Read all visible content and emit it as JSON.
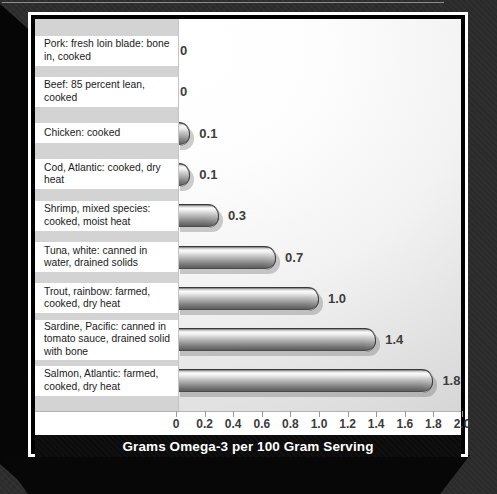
{
  "chart_data": {
    "type": "bar",
    "orientation": "horizontal",
    "title": "Grams Omega-3 per 100 Gram Serving",
    "xlabel": "Grams Omega-3 per 100 Gram Serving",
    "ylabel": "",
    "xlim": [
      0,
      2.0
    ],
    "xticks": [
      "0",
      "0.2",
      "0.4",
      "0.6",
      "0.8",
      "1.0",
      "1.2",
      "1.4",
      "1.6",
      "1.8",
      "2.0"
    ],
    "xtick_values": [
      0,
      0.2,
      0.4,
      0.6,
      0.8,
      1.0,
      1.2,
      1.4,
      1.6,
      1.8,
      2.0
    ],
    "grid": false,
    "legend": null,
    "categories": [
      "Pork: fresh loin blade: bone in, cooked",
      "Beef: 85 percent lean, cooked",
      "Chicken: cooked",
      "Cod, Atlantic: cooked, dry heat",
      "Shrimp, mixed species: cooked, moist heat",
      "Tuna, white: canned in water, drained solids",
      "Trout, rainbow: farmed, cooked, dry heat",
      "Sardine, Pacific: canned in tomato sauce, drained solid with bone",
      "Salmon, Atlantic: farmed, cooked, dry heat"
    ],
    "values": [
      0,
      0,
      0.1,
      0.1,
      0.3,
      0.7,
      1.0,
      1.4,
      1.8
    ],
    "value_labels": [
      "0",
      "0",
      "0.1",
      "0.1",
      "0.3",
      "0.7",
      "1.0",
      "1.4",
      "1.8"
    ]
  },
  "rows": [
    {
      "label": "Pork: fresh loin blade: bone in, cooked",
      "value": 0,
      "value_label": "0"
    },
    {
      "label": "Beef: 85 percent lean, cooked",
      "value": 0,
      "value_label": "0"
    },
    {
      "label": "Chicken: cooked",
      "value": 0.1,
      "value_label": "0.1"
    },
    {
      "label": "Cod, Atlantic: cooked, dry heat",
      "value": 0.1,
      "value_label": "0.1"
    },
    {
      "label": "Shrimp, mixed species: cooked, moist heat",
      "value": 0.3,
      "value_label": "0.3"
    },
    {
      "label": "Tuna, white: canned in water, drained solids",
      "value": 0.7,
      "value_label": "0.7"
    },
    {
      "label": "Trout, rainbow: farmed, cooked, dry heat",
      "value": 1.0,
      "value_label": "1.0"
    },
    {
      "label": "Sardine, Pacific: canned in tomato sauce, drained solid with bone",
      "value": 1.4,
      "value_label": "1.4"
    },
    {
      "label": "Salmon, Atlantic: farmed, cooked, dry heat",
      "value": 1.8,
      "value_label": "1.8"
    }
  ],
  "axis": {
    "ticks": [
      "0",
      "0.2",
      "0.4",
      "0.6",
      "0.8",
      "1.0",
      "1.2",
      "1.4",
      "1.6",
      "1.8",
      "2.0"
    ]
  },
  "title": {
    "text": "Grams Omega-3 per 100 Gram Serving"
  },
  "colors": {
    "frame": "#2c2c2c",
    "title_bar": "#0b0b0b",
    "title_text": "#ffffff",
    "label_panel": "#d3d3d3",
    "label_block": "#ffffff",
    "bar_light": "#fbfbfb",
    "bar_dark": "#5e5e5e",
    "value_text": "#3d3d3d",
    "tick_text": "#3b3b3b"
  }
}
